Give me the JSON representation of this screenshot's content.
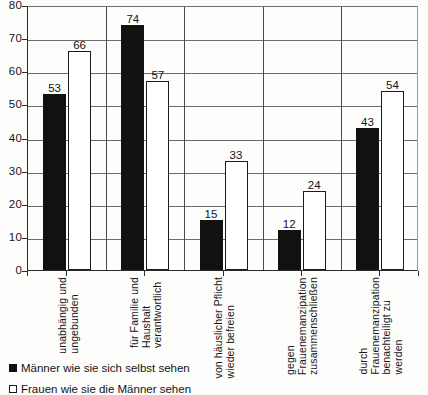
{
  "chart_data": {
    "type": "bar",
    "title": "",
    "xlabel": "",
    "ylabel": "",
    "ylim": [
      0,
      80
    ],
    "yticks": [
      0,
      10,
      20,
      30,
      40,
      50,
      60,
      70,
      80
    ],
    "grid": true,
    "legend_position": "bottom-left",
    "categories": [
      "unabhängig und ungebunden",
      "für Familie und Haushalt verantwortlich",
      "von häuslicher Pflicht wieder befreien",
      "gegen Frauenemanzipation zusammenschließen",
      "durch Frauenemanzipation benachteiligt zu werden"
    ],
    "category_lines": [
      [
        "unabhängig und",
        "ungebunden"
      ],
      [
        "für Familie und",
        "Haushalt",
        "verantwortlich"
      ],
      [
        "von häuslicher Pflicht",
        "wieder befreien"
      ],
      [
        "gegen",
        "Frauenemanzipation",
        "zusammenschließen"
      ],
      [
        "durch",
        "Frauenemanzipation",
        "benachteiligt zu",
        "werden"
      ]
    ],
    "series": [
      {
        "name": "Männer wie sie sich selbst sehen",
        "style": "dark",
        "color": "#111111",
        "values": [
          53,
          74,
          15,
          12,
          43
        ]
      },
      {
        "name": "Frauen wie sie die Männer sehen",
        "style": "light",
        "color": "#ffffff",
        "values": [
          66,
          57,
          33,
          24,
          54
        ]
      }
    ]
  },
  "legend": {
    "items": [
      {
        "label": "Männer wie sie sich selbst sehen",
        "swatch": "dark"
      },
      {
        "label": "Frauen wie sie die Männer sehen",
        "swatch": "light"
      }
    ]
  }
}
